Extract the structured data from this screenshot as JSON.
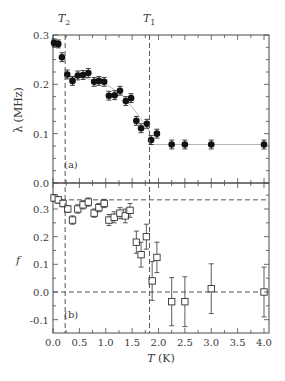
{
  "chart_data": [
    {
      "type": "scatter",
      "panel_label": "(a)",
      "title": "",
      "xlabel": "T (K)",
      "ylabel": "λ (MHz)",
      "xlim": [
        0.0,
        4.0
      ],
      "ylim": [
        0.0,
        0.3
      ],
      "xticks": [
        "0.0",
        "0.5",
        "1.0",
        "1.5",
        "2.0",
        "2.5",
        "3.0",
        "3.5",
        "4.0"
      ],
      "yticks": [
        "0.0",
        "0.1",
        "0.2",
        "0.3"
      ],
      "grid": false,
      "marker": "filled-circle",
      "vertical_lines": [
        {
          "label": "T2",
          "x": 0.23,
          "style": "dashed"
        },
        {
          "label": "T1",
          "x": 1.83,
          "style": "dashed"
        }
      ],
      "series": [
        {
          "name": "λ",
          "x": [
            0.02,
            0.1,
            0.17,
            0.27,
            0.37,
            0.47,
            0.57,
            0.67,
            0.78,
            0.87,
            0.97,
            1.06,
            1.17,
            1.27,
            1.38,
            1.48,
            1.58,
            1.67,
            1.78,
            1.86,
            1.97,
            2.25,
            2.5,
            3.0,
            4.0
          ],
          "y": [
            0.284,
            0.282,
            0.255,
            0.22,
            0.207,
            0.218,
            0.219,
            0.223,
            0.205,
            0.207,
            0.205,
            0.177,
            0.178,
            0.187,
            0.166,
            0.172,
            0.126,
            0.111,
            0.12,
            0.087,
            0.1,
            0.078,
            0.078,
            0.078,
            0.078
          ],
          "yerr": [
            0.008,
            0.008,
            0.009,
            0.009,
            0.009,
            0.009,
            0.009,
            0.009,
            0.009,
            0.009,
            0.009,
            0.009,
            0.009,
            0.009,
            0.009,
            0.009,
            0.009,
            0.009,
            0.009,
            0.009,
            0.009,
            0.009,
            0.009,
            0.009,
            0.009
          ]
        }
      ],
      "fit_line": {
        "description": "thin grey guide curve through data, flat at 0.078 above T1",
        "x": [
          0.25,
          0.6,
          1.0,
          1.3,
          1.6,
          1.83,
          1.84,
          4.0
        ],
        "y": [
          0.215,
          0.213,
          0.2,
          0.18,
          0.14,
          0.105,
          0.078,
          0.078
        ]
      }
    },
    {
      "type": "scatter",
      "panel_label": "(b)",
      "title": "",
      "xlabel": "T (K)",
      "ylabel": "f",
      "xlim": [
        0.0,
        4.0
      ],
      "ylim": [
        -0.15,
        0.38
      ],
      "xticks": [
        "0.0",
        "0.5",
        "1.0",
        "1.5",
        "2.0",
        "2.5",
        "3.0",
        "3.5",
        "4.0"
      ],
      "yticks": [
        "-0.1",
        "0.0",
        "0.1",
        "0.2",
        "0.3"
      ],
      "grid": false,
      "marker": "open-square",
      "vertical_lines": [
        {
          "label": "T2",
          "x": 0.23,
          "style": "dashed"
        },
        {
          "label": "T1",
          "x": 1.83,
          "style": "dashed"
        }
      ],
      "horizontal_lines": [
        {
          "y": 0.333,
          "style": "dashed"
        },
        {
          "y": 0.0,
          "style": "dashed"
        }
      ],
      "series": [
        {
          "name": "f",
          "x": [
            0.02,
            0.1,
            0.19,
            0.28,
            0.37,
            0.47,
            0.57,
            0.67,
            0.78,
            0.87,
            0.97,
            1.06,
            1.16,
            1.27,
            1.37,
            1.46,
            1.58,
            1.67,
            1.77,
            1.88,
            1.97,
            2.25,
            2.5,
            3.0,
            4.0
          ],
          "y": [
            0.34,
            0.333,
            0.32,
            0.3,
            0.26,
            0.3,
            0.315,
            0.325,
            0.285,
            0.305,
            0.32,
            0.26,
            0.27,
            0.285,
            0.275,
            0.295,
            0.18,
            0.135,
            0.2,
            0.04,
            0.125,
            -0.035,
            -0.035,
            0.012,
            0.0
          ],
          "yerr": [
            0.012,
            0.012,
            0.012,
            0.012,
            0.015,
            0.015,
            0.015,
            0.015,
            0.015,
            0.015,
            0.015,
            0.02,
            0.02,
            0.02,
            0.025,
            0.025,
            0.04,
            0.045,
            0.045,
            0.07,
            0.055,
            0.087,
            0.09,
            0.09,
            0.09
          ]
        }
      ]
    }
  ],
  "labels": {
    "t2": "T",
    "t2_sub": "2",
    "t1": "T",
    "t1_sub": "1",
    "panel_a": "(a)",
    "panel_b": "(b)",
    "ylabel_a": "λ (MHz)",
    "ylabel_b": "f",
    "xlabel_T": "T",
    "xlabel_unit": " (K)"
  },
  "colors": {
    "axis": "#4a4a4a",
    "marker": "#111111",
    "guide_line": "#b8b8b8",
    "dashed": "#555555",
    "text": "#3a3a3a"
  }
}
